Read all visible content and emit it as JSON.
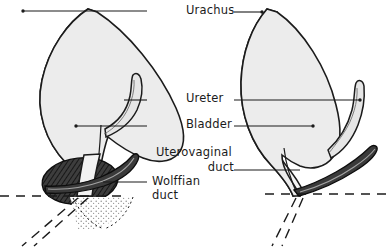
{
  "figure": {
    "background_color": "#ffffff",
    "ink_color": "#1b1b1b",
    "bladder_fill": "#ececec",
    "bladder_wall_fill": "#f7f7f7",
    "wolffian_duct_fill": "#3a3a3a",
    "uterovaginal_mass_fill": "#3d3d3d",
    "stipple_color": "#8a8a8a"
  },
  "labels": {
    "urachus": "Urachus",
    "ureter": "Ureter",
    "bladder": "Bladder",
    "uterovaginal_duct_line1": "Uterovaginal",
    "uterovaginal_duct_line2": "duct",
    "wolffian_duct_line1": "Wolffian",
    "wolffian_duct_line2": "duct"
  },
  "panels": [
    {
      "id": "left-panel",
      "name": "earlier-stage",
      "structures": [
        "bladder",
        "urachus",
        "ureter",
        "uterovaginal-duct-mass",
        "wolffian-duct",
        "stippled-sinus-region"
      ]
    },
    {
      "id": "right-panel",
      "name": "later-stage",
      "structures": [
        "bladder",
        "urachus",
        "ureter",
        "wolffian-duct"
      ]
    }
  ]
}
